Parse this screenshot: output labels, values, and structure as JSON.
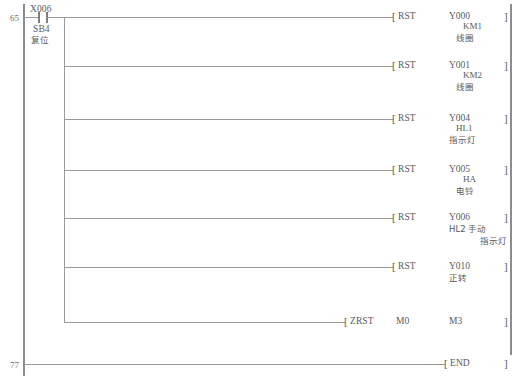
{
  "diagram": {
    "type": "plc-ladder-logic",
    "left_rail_x": 23,
    "right_rail_x": 511,
    "branch_x": 64,
    "rungs": [
      {
        "number": "65",
        "input": {
          "device": "X006",
          "tag": "SB4",
          "note": "复位",
          "contact_type": "normally-open"
        }
      },
      {
        "number": "77",
        "instruction": "END"
      }
    ],
    "outputs": [
      {
        "instruction": "RST",
        "operand": "Y000",
        "tag": "KM1",
        "note": "线圈",
        "layout": "indent-tag"
      },
      {
        "instruction": "RST",
        "operand": "Y001",
        "tag": "KM2",
        "note": "线圈",
        "layout": "indent-tag"
      },
      {
        "instruction": "RST",
        "operand": "Y004",
        "tag": "HL1",
        "note": "指示灯",
        "layout": "center-tag"
      },
      {
        "instruction": "RST",
        "operand": "Y005",
        "tag": "HA",
        "note": "电铃",
        "layout": "indent-tag"
      },
      {
        "instruction": "RST",
        "operand": "Y006",
        "tag": "HL2 手动",
        "note": "指示灯",
        "layout": "wide-tag"
      },
      {
        "instruction": "RST",
        "operand": "Y010",
        "tag": "正转",
        "note": "",
        "layout": "plain"
      }
    ],
    "zrst": {
      "instruction": "ZRST",
      "operand1": "M0",
      "operand2": "M3"
    },
    "end_row": {
      "number": "77",
      "instruction": "END"
    },
    "brackets": {
      "open": "[",
      "close": "]"
    },
    "caption": ""
  }
}
